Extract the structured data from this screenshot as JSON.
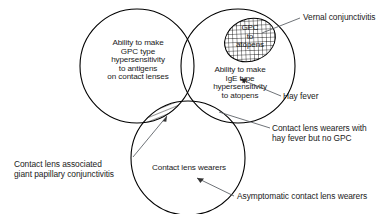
{
  "diagram": {
    "background_color": "#ffffff",
    "stroke_color": "#000000",
    "leader_color": "#555a60"
  },
  "circles": [
    {
      "id": "gpc-antigens",
      "label": "Ability to make\nGPC type\nhypersensitivity\nto antigens\non contact lenses",
      "cx": 137,
      "cy": 66,
      "r": 57
    },
    {
      "id": "ige-atopens",
      "label": "Ability to make\nIgE   type\nhypersensitivity\nto atopens",
      "cx": 238,
      "cy": 66,
      "r": 57
    },
    {
      "id": "contact-lens-wearers",
      "label": "Contact lens wearers",
      "cx": 188,
      "cy": 158,
      "r": 57
    }
  ],
  "regions": [
    {
      "id": "gpc-to-atopens",
      "label": "GPC\nto\natopens",
      "fill": "crosshatch",
      "cx": 250,
      "cy": 40,
      "rx": 26,
      "ry": 21,
      "rotation": -22
    },
    {
      "id": "left-bottom-lens",
      "label": "",
      "fill": "diagonal-hatch"
    },
    {
      "id": "triple-overlap",
      "label": "",
      "fill": "crosshatch"
    }
  ],
  "callouts": [
    {
      "id": "vernal-conjunctivitis",
      "label": "Vernal conjunctivitis"
    },
    {
      "id": "hay-fever",
      "label": "Hay fever"
    },
    {
      "id": "contact-lens-hayfever-no-gpc",
      "label": "Contact lens wearers with\nhay fever but no GPC"
    },
    {
      "id": "asymptomatic-contact-lens-wearers",
      "label": "Asymptomatic contact lens wearers"
    },
    {
      "id": "contact-lens-associated-gpc",
      "label": "Contact lens associated\ngiant papillary conjunctivitis"
    }
  ]
}
